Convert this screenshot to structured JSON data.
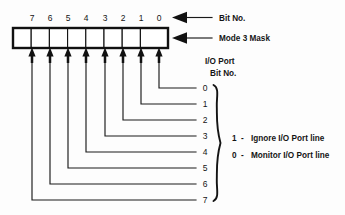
{
  "diagram": {
    "register": {
      "bit_numbers": [
        "7",
        "6",
        "5",
        "4",
        "3",
        "2",
        "1",
        "0"
      ],
      "cell_count": 8
    },
    "callouts": {
      "bit_no": "Bit No.",
      "mode_3_mask": "Mode 3 Mask"
    },
    "group_heading": {
      "line1": "I/O Port",
      "line2": "Bit No."
    },
    "port_bit_numbers": [
      "0",
      "1",
      "2",
      "3",
      "4",
      "5",
      "6",
      "7"
    ],
    "legend": [
      {
        "value": "1",
        "dash": "-",
        "text": "Ignore I/O Port line"
      },
      {
        "value": "0",
        "dash": "-",
        "text": "Monitor I/O Port line"
      }
    ],
    "colors": {
      "ink": "#111111",
      "background": "#fdfdfd",
      "cell_fill": "#ffffff"
    }
  }
}
